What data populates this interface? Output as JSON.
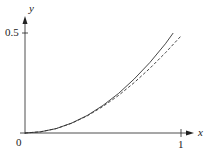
{
  "chart_data": {
    "type": "line",
    "title": "",
    "xlabel": "x",
    "ylabel": "y",
    "xlim": [
      0,
      1.06
    ],
    "ylim": [
      0,
      0.56
    ],
    "x_ticks": [
      "1"
    ],
    "y_ticks": [
      "0.5"
    ],
    "origin_label": "0",
    "grid": false,
    "legend": null,
    "series": [
      {
        "name": "solid curve",
        "style": "solid",
        "x": [
          0,
          0.1,
          0.2,
          0.3,
          0.4,
          0.5,
          0.6,
          0.7,
          0.8,
          0.9,
          0.95
        ],
        "y": [
          0,
          0.006,
          0.022,
          0.05,
          0.088,
          0.138,
          0.198,
          0.27,
          0.352,
          0.446,
          0.5
        ]
      },
      {
        "name": "dashed curve",
        "style": "dashed",
        "x": [
          0,
          0.1,
          0.2,
          0.3,
          0.4,
          0.5,
          0.6,
          0.7,
          0.8,
          0.9,
          1.0
        ],
        "y": [
          0,
          0.006,
          0.022,
          0.049,
          0.086,
          0.133,
          0.188,
          0.252,
          0.323,
          0.401,
          0.485
        ]
      }
    ]
  },
  "labels": {
    "y_axis": "y",
    "x_axis": "x",
    "y_tick": "0.5",
    "x_tick": "1",
    "origin": "0"
  }
}
